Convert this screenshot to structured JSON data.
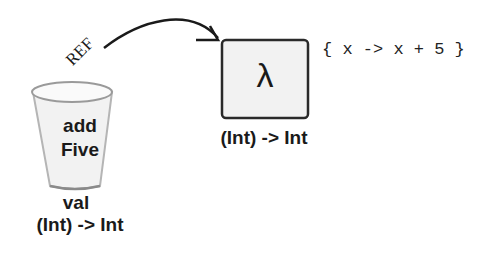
{
  "variable": {
    "keyword": "val",
    "name_line1": "add",
    "name_line2": "Five",
    "type": "(Int) -> Int"
  },
  "reference": {
    "label": "REF"
  },
  "lambda_object": {
    "symbol": "λ",
    "type": "(Int) -> Int",
    "body": "{ x -> x + 5 }"
  },
  "colors": {
    "ink": "#1a1a1a",
    "fill": "#f2f2f2"
  }
}
